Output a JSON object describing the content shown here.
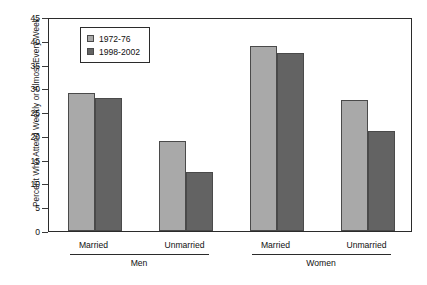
{
  "chart_data": {
    "type": "bar",
    "title": "",
    "xlabel": "",
    "ylabel": "Percent Who Attend Weekly or Almost Every Week",
    "ylim": [
      0,
      45
    ],
    "yticks": [
      0,
      5,
      10,
      15,
      20,
      25,
      30,
      35,
      40,
      45
    ],
    "grid": false,
    "legend_position": "upper-left-inside",
    "categories": [
      "Married",
      "Unmarried",
      "Married",
      "Unmarried"
    ],
    "groups": [
      {
        "label": "Men",
        "categories": [
          "Married",
          "Unmarried"
        ]
      },
      {
        "label": "Women",
        "categories": [
          "Married",
          "Unmarried"
        ]
      }
    ],
    "series": [
      {
        "name": "1972-76",
        "color": "#a9a9a9",
        "values": [
          29,
          19,
          39,
          27.5
        ]
      },
      {
        "name": "1998-2002",
        "color": "#636363",
        "values": [
          28,
          12.5,
          37.5,
          21
        ]
      }
    ]
  },
  "legend": {
    "entries": [
      {
        "label": "1972-76"
      },
      {
        "label": "1998-2002"
      }
    ]
  },
  "axis": {
    "y_title": "Percent Who Attend Weekly or Almost Every Week",
    "y_tick_labels": [
      "45",
      "40",
      "35",
      "30",
      "25",
      "20",
      "15",
      "10",
      "5",
      "0"
    ]
  },
  "x_axis": {
    "category_labels": [
      "Married",
      "Unmarried",
      "Married",
      "Unmarried"
    ],
    "group_labels": [
      "Men",
      "Women"
    ]
  },
  "caption": {
    "text": ""
  }
}
